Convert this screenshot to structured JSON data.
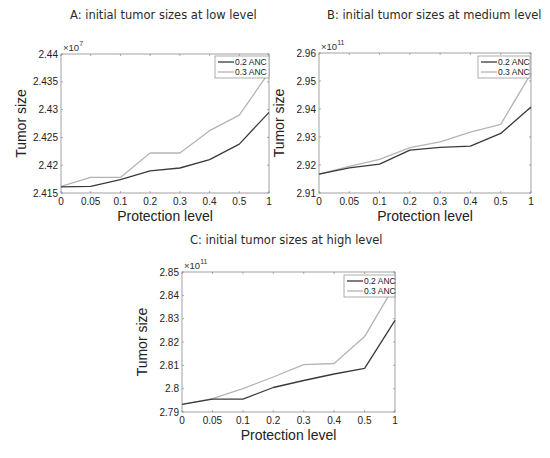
{
  "chart_data": [
    {
      "type": "line",
      "title": "A: initial tumor sizes at low level",
      "xlabel": "Protection level",
      "ylabel": "Tumor size",
      "y_multiplier": "×10^7",
      "y_exponent": "7",
      "categories": [
        "0",
        "0.05",
        "0.1",
        "0.2",
        "0.3",
        "0.4",
        "0.5",
        "1"
      ],
      "ylim": [
        2.415,
        2.44
      ],
      "yticks": [
        2.415,
        2.42,
        2.425,
        2.43,
        2.435,
        2.44
      ],
      "ytick_labels": [
        "2.415",
        "2.42",
        "2.425",
        "2.43",
        "2.435",
        "2.44"
      ],
      "grid": false,
      "legend_position": "upper right",
      "series": [
        {
          "name": "0.2 ANC",
          "color": "#3a3a3a",
          "values": [
            2.4161,
            2.4162,
            2.4174,
            2.419,
            2.4195,
            2.421,
            2.4238,
            2.4295
          ]
        },
        {
          "name": "0.3 ANC",
          "color": "#b4b4b4",
          "values": [
            2.4162,
            2.4178,
            2.4178,
            2.4222,
            2.4222,
            2.4262,
            2.429,
            2.4367
          ]
        }
      ]
    },
    {
      "type": "line",
      "title": "B: initial tumor sizes at medium level",
      "xlabel": "Protection level",
      "ylabel": "Tumor size",
      "y_multiplier": "×10^11",
      "y_exponent": "11",
      "categories": [
        "0",
        "0.05",
        "0.1",
        "0.2",
        "0.3",
        "0.4",
        "0.5",
        "1"
      ],
      "ylim": [
        2.91,
        2.96
      ],
      "yticks": [
        2.91,
        2.92,
        2.93,
        2.94,
        2.95,
        2.96
      ],
      "ytick_labels": [
        "2.91",
        "2.92",
        "2.93",
        "2.94",
        "2.95",
        "2.96"
      ],
      "grid": false,
      "legend_position": "upper right",
      "series": [
        {
          "name": "0.2 ANC",
          "color": "#3a3a3a",
          "values": [
            2.9167,
            2.919,
            2.9203,
            2.9253,
            2.9263,
            2.9267,
            2.9313,
            2.9407
          ]
        },
        {
          "name": "0.3 ANC",
          "color": "#b4b4b4",
          "values": [
            2.9167,
            2.9195,
            2.922,
            2.9262,
            2.9283,
            2.9317,
            2.9345,
            2.9527
          ]
        }
      ]
    },
    {
      "type": "line",
      "title": "C: initial tumor sizes at high level",
      "xlabel": "Protection level",
      "ylabel": "Tumor size",
      "y_multiplier": "×10^11",
      "y_exponent": "11",
      "categories": [
        "0",
        "0.05",
        "0.1",
        "0.2",
        "0.3",
        "0.4",
        "0.5",
        "1"
      ],
      "ylim": [
        2.79,
        2.85
      ],
      "yticks": [
        2.79,
        2.8,
        2.81,
        2.82,
        2.83,
        2.84,
        2.85
      ],
      "ytick_labels": [
        "2.79",
        "2.8",
        "2.81",
        "2.82",
        "2.83",
        "2.84",
        "2.85"
      ],
      "grid": false,
      "legend_position": "upper right",
      "series": [
        {
          "name": "0.2 ANC",
          "color": "#3a3a3a",
          "values": [
            2.7933,
            2.7955,
            2.7955,
            2.8005,
            2.8035,
            2.8063,
            2.8087,
            2.8293
          ]
        },
        {
          "name": "0.3 ANC",
          "color": "#b4b4b4",
          "values": [
            2.7933,
            2.7957,
            2.8,
            2.805,
            2.8103,
            2.8108,
            2.8223,
            2.8445
          ]
        }
      ]
    }
  ],
  "layout": {
    "panels": [
      {
        "title_x": 70,
        "title_y": 8,
        "plot": {
          "x": 61,
          "y": 54,
          "w": 208,
          "h": 139
        },
        "legend": {
          "x": 215,
          "y": 56,
          "w": 54,
          "h": 22
        }
      },
      {
        "title_x": 327,
        "title_y": 8,
        "plot": {
          "x": 319,
          "y": 53,
          "w": 212,
          "h": 140
        },
        "legend": {
          "x": 478,
          "y": 56,
          "w": 52,
          "h": 22
        }
      },
      {
        "title_x": 190,
        "title_y": 233,
        "plot": {
          "x": 182,
          "y": 272,
          "w": 213,
          "h": 140
        },
        "legend": {
          "x": 344,
          "y": 275,
          "w": 51,
          "h": 22
        }
      }
    ]
  }
}
